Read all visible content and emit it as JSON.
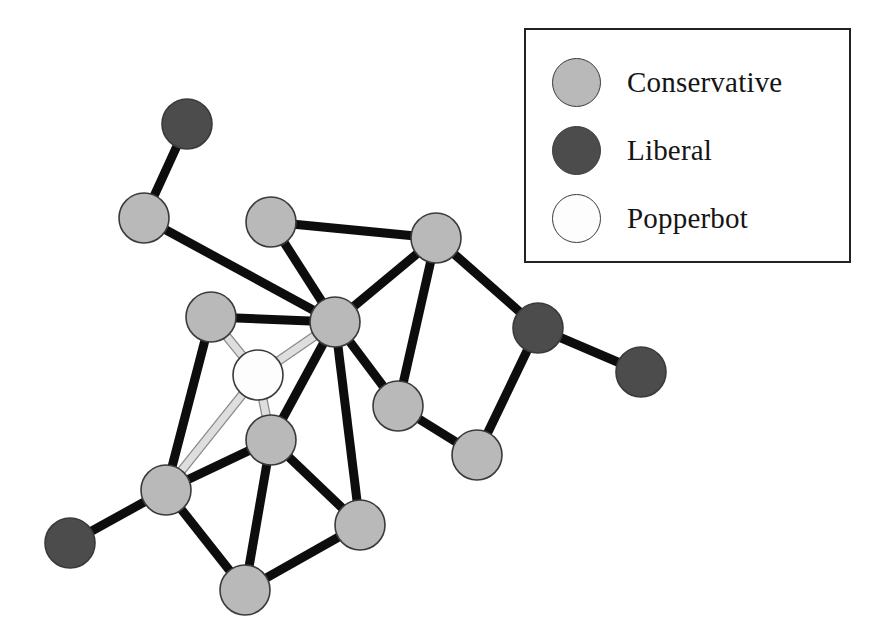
{
  "figure": {
    "type": "network-graph",
    "background_color": "#ffffff"
  },
  "legend": {
    "border_color": "#222222",
    "items": [
      {
        "label": "Conservative",
        "color": "#b9b9b9",
        "swatch_name": "conservative-swatch"
      },
      {
        "label": "Liberal",
        "color": "#4c4c4c",
        "swatch_name": "liberal-swatch"
      },
      {
        "label": "Popperbot",
        "color": "#fdfdfd",
        "swatch_name": "popperbot-swatch"
      }
    ]
  },
  "chart_data": {
    "type": "network",
    "title": "",
    "node_radius": 25,
    "edge_width_dark": 9,
    "edge_width_light": 7,
    "edge_color_dark": "#0d0d0d",
    "edge_color_light": "#dedede",
    "edge_outline_light": "#8a8a8a",
    "node_outline": "#3a3a3a",
    "categories": [
      "Conservative",
      "Liberal",
      "Popperbot"
    ],
    "category_colors": {
      "Conservative": "#b9b9b9",
      "Liberal": "#4c4c4c",
      "Popperbot": "#fdfdfd"
    },
    "counts": {
      "Conservative": 12,
      "Liberal": 4,
      "Popperbot": 1
    },
    "nodes": [
      {
        "id": "L1",
        "group": "Liberal",
        "x": 187,
        "y": 124
      },
      {
        "id": "C1",
        "group": "Conservative",
        "x": 144,
        "y": 218
      },
      {
        "id": "C2",
        "group": "Conservative",
        "x": 271,
        "y": 222
      },
      {
        "id": "C3",
        "group": "Conservative",
        "x": 436,
        "y": 238
      },
      {
        "id": "C4",
        "group": "Conservative",
        "x": 211,
        "y": 317
      },
      {
        "id": "H",
        "group": "Conservative",
        "x": 335,
        "y": 322
      },
      {
        "id": "L2",
        "group": "Liberal",
        "x": 538,
        "y": 328
      },
      {
        "id": "P",
        "group": "Popperbot",
        "x": 258,
        "y": 375
      },
      {
        "id": "L3",
        "group": "Liberal",
        "x": 641,
        "y": 372
      },
      {
        "id": "C5",
        "group": "Conservative",
        "x": 398,
        "y": 406
      },
      {
        "id": "C6",
        "group": "Conservative",
        "x": 271,
        "y": 440
      },
      {
        "id": "C7",
        "group": "Conservative",
        "x": 477,
        "y": 455
      },
      {
        "id": "C8",
        "group": "Conservative",
        "x": 166,
        "y": 490
      },
      {
        "id": "C9",
        "group": "Conservative",
        "x": 360,
        "y": 525
      },
      {
        "id": "L4",
        "group": "Liberal",
        "x": 70,
        "y": 543
      },
      {
        "id": "C10",
        "group": "Conservative",
        "x": 245,
        "y": 590
      }
    ],
    "edges": [
      {
        "source": "L1",
        "target": "C1",
        "style": "dark"
      },
      {
        "source": "C1",
        "target": "H",
        "style": "dark"
      },
      {
        "source": "C2",
        "target": "C3",
        "style": "dark"
      },
      {
        "source": "C2",
        "target": "H",
        "style": "dark"
      },
      {
        "source": "C3",
        "target": "H",
        "style": "dark"
      },
      {
        "source": "C3",
        "target": "L2",
        "style": "dark"
      },
      {
        "source": "C3",
        "target": "C5",
        "style": "dark"
      },
      {
        "source": "C4",
        "target": "H",
        "style": "dark"
      },
      {
        "source": "C4",
        "target": "C8",
        "style": "dark"
      },
      {
        "source": "C4",
        "target": "P",
        "style": "light"
      },
      {
        "source": "H",
        "target": "P",
        "style": "light"
      },
      {
        "source": "H",
        "target": "C5",
        "style": "dark"
      },
      {
        "source": "H",
        "target": "C6",
        "style": "dark"
      },
      {
        "source": "H",
        "target": "C9",
        "style": "dark"
      },
      {
        "source": "L2",
        "target": "L3",
        "style": "dark"
      },
      {
        "source": "L2",
        "target": "C7",
        "style": "dark"
      },
      {
        "source": "P",
        "target": "C6",
        "style": "light"
      },
      {
        "source": "P",
        "target": "C8",
        "style": "light"
      },
      {
        "source": "C5",
        "target": "C7",
        "style": "dark"
      },
      {
        "source": "C6",
        "target": "C8",
        "style": "dark"
      },
      {
        "source": "C6",
        "target": "C9",
        "style": "dark"
      },
      {
        "source": "C6",
        "target": "C10",
        "style": "dark"
      },
      {
        "source": "C8",
        "target": "L4",
        "style": "dark"
      },
      {
        "source": "C8",
        "target": "C10",
        "style": "dark"
      },
      {
        "source": "C9",
        "target": "C10",
        "style": "dark"
      }
    ]
  }
}
